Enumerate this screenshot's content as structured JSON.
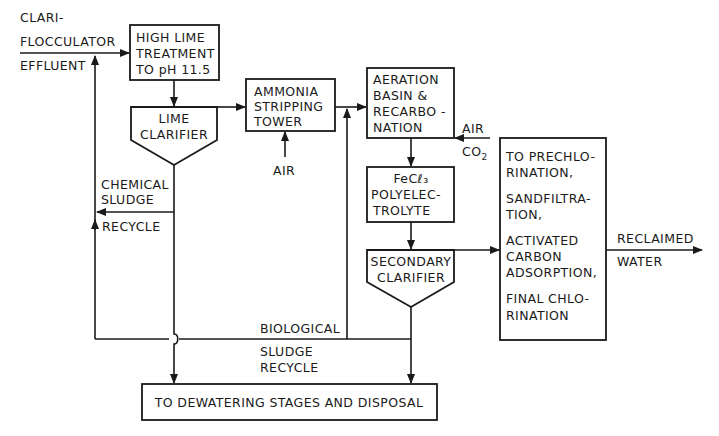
{
  "diagram": {
    "type": "process-flow",
    "inputs": {
      "effluent_label": [
        "CLARI-",
        "FLOCCULATOR",
        "EFFLUENT"
      ],
      "stripping_air": "AIR",
      "aeration_air": "AIR",
      "aeration_co2": "CO",
      "aeration_co2_sub": "2"
    },
    "nodes": {
      "high_lime": [
        "HIGH LIME",
        "TREATMENT",
        "TO pH 11.5"
      ],
      "lime_clarifier": [
        "LIME",
        "CLARIFIER"
      ],
      "ammonia_stripping": [
        "AMMONIA",
        "STRIPPING",
        "TOWER"
      ],
      "aeration": [
        "AERATION",
        "BASIN &",
        "RECARBO -",
        "NATION"
      ],
      "fecl3": [
        "FeCℓ₃",
        "POLYELEC-",
        "TROLYTE"
      ],
      "secondary_clarifier": [
        "SECONDARY",
        "CLARIFIER"
      ],
      "tertiary": [
        "TO PRECHLO-",
        "RINATION,",
        "SANDFILTRA-",
        "TION,",
        "ACTIVATED",
        "CARBON",
        "ADSORPTION,",
        "FINAL CHLO-",
        "RINATION"
      ],
      "dewatering": "TO DEWATERING STAGES AND DISPOSAL"
    },
    "labels": {
      "chemical_sludge": [
        "CHEMICAL",
        "SLUDGE"
      ],
      "chemical_recycle": "RECYCLE",
      "biological": "BIOLOGICAL",
      "biological_sludge_recycle": [
        "SLUDGE",
        "RECYCLE"
      ],
      "output": [
        "RECLAIMED",
        "WATER"
      ]
    },
    "colors": {
      "line": "#1a1a1a",
      "background": "#ffffff"
    }
  }
}
